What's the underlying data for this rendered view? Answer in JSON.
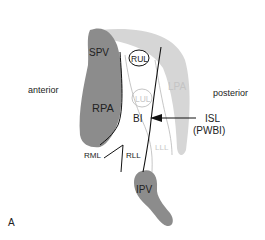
{
  "figure": {
    "panel_label": "A",
    "orientation": {
      "left": "anterior",
      "right": "posterior"
    },
    "structures": {
      "spv": "SPV",
      "rpa": "RPA",
      "lpa": "LPA",
      "rul": "RUL",
      "lul": "LUL",
      "bi": "BI",
      "rml": "RML",
      "rll": "RLL",
      "lll": "LLL",
      "ipv": "IPV"
    },
    "annotation": {
      "line1": "ISL",
      "line2": "(PWBI)"
    },
    "colors": {
      "dark_gray": "#8a8a8a",
      "light_gray": "#d4d4d4",
      "line": "#111111",
      "faint_line": "#b0b0b0",
      "text": "#222222",
      "faint_text": "#c8c8c8"
    }
  }
}
